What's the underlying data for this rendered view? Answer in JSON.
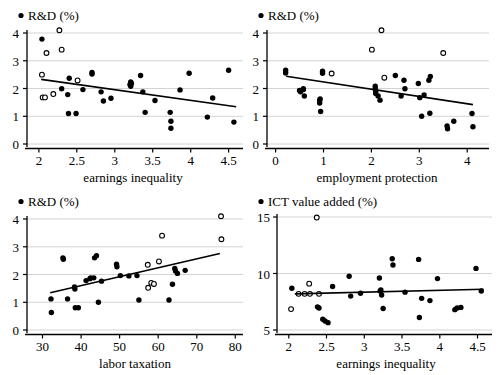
{
  "figure": {
    "title": "",
    "panel_count": 4
  },
  "chart_data": [
    {
      "type": "scatter",
      "panel": "top-left",
      "title": "",
      "legend": [
        {
          "label": "R&D (%)",
          "marker": "filled-circle"
        }
      ],
      "ylabel": "R&D (%)",
      "xlabel": "earnings inequality",
      "xlim": [
        1.85,
        4.7
      ],
      "ylim": [
        -0.25,
        4.35
      ],
      "xticks": [
        2,
        2.5,
        3,
        3.5,
        4,
        4.5
      ],
      "xticklabels": [
        "2",
        "2.5",
        "3",
        "3.5",
        "4",
        "4.5"
      ],
      "yticks": [
        0,
        1,
        2,
        3,
        4
      ],
      "yticklabels": [
        "0",
        "1",
        "2",
        "3",
        "4"
      ],
      "grid": "horizontal",
      "series": [
        {
          "name": "filled",
          "marker": "filled-circle",
          "points": [
            [
              2.04,
              3.78
            ],
            [
              2.3,
              1.99
            ],
            [
              2.38,
              1.78
            ],
            [
              2.4,
              2.37
            ],
            [
              2.39,
              1.1
            ],
            [
              2.49,
              1.1
            ],
            [
              2.58,
              1.96
            ],
            [
              2.7,
              2.58
            ],
            [
              2.7,
              2.52
            ],
            [
              2.82,
              1.88
            ],
            [
              2.85,
              1.55
            ],
            [
              2.95,
              1.65
            ],
            [
              3.2,
              2.14
            ],
            [
              3.21,
              2.24
            ],
            [
              3.21,
              2.08
            ],
            [
              3.22,
              2.18
            ],
            [
              3.34,
              2.47
            ],
            [
              3.37,
              1.88
            ],
            [
              3.4,
              1.14
            ],
            [
              3.53,
              1.57
            ],
            [
              3.73,
              1.14
            ],
            [
              3.74,
              0.82
            ],
            [
              3.74,
              0.57
            ],
            [
              3.86,
              1.95
            ],
            [
              3.98,
              2.55
            ],
            [
              4.22,
              0.97
            ],
            [
              4.29,
              1.66
            ],
            [
              4.5,
              2.66
            ],
            [
              4.57,
              0.79
            ]
          ]
        },
        {
          "name": "open",
          "marker": "open-circle",
          "points": [
            [
              2.04,
              2.5
            ],
            [
              2.05,
              1.68
            ],
            [
              2.08,
              1.68
            ],
            [
              2.1,
              3.28
            ],
            [
              2.19,
              1.8
            ],
            [
              2.27,
              4.1
            ],
            [
              2.3,
              3.4
            ],
            [
              2.51,
              2.29
            ]
          ]
        }
      ],
      "fit_line": {
        "x": [
          2.03,
          4.6
        ],
        "y": [
          2.33,
          1.34
        ]
      }
    },
    {
      "type": "scatter",
      "panel": "top-right",
      "title": "",
      "legend": [
        {
          "label": "R&D (%)",
          "marker": "filled-circle"
        }
      ],
      "ylabel": "R&D (%)",
      "xlabel": "employment protection",
      "xlim": [
        -0.18,
        4.45
      ],
      "ylim": [
        -0.25,
        4.35
      ],
      "xticks": [
        0,
        1,
        2,
        3,
        4
      ],
      "xticklabels": [
        "0",
        "1",
        "2",
        "3",
        "4"
      ],
      "yticks": [
        0,
        1,
        2,
        3,
        4
      ],
      "yticklabels": [
        "0",
        "1",
        "2",
        "3",
        "4"
      ],
      "grid": "horizontal",
      "series": [
        {
          "name": "filled",
          "marker": "filled-circle",
          "points": [
            [
              0.21,
              2.66
            ],
            [
              0.21,
              2.56
            ],
            [
              0.5,
              1.93
            ],
            [
              0.52,
              1.88
            ],
            [
              0.58,
              1.96
            ],
            [
              0.58,
              1.99
            ],
            [
              0.6,
              1.73
            ],
            [
              0.92,
              1.58
            ],
            [
              0.92,
              1.48
            ],
            [
              0.93,
              1.62
            ],
            [
              0.94,
              1.17
            ],
            [
              0.98,
              2.62
            ],
            [
              0.98,
              2.55
            ],
            [
              2.08,
              1.98
            ],
            [
              2.08,
              2.08
            ],
            [
              2.09,
              1.9
            ],
            [
              2.09,
              1.82
            ],
            [
              2.14,
              1.73
            ],
            [
              2.18,
              1.58
            ],
            [
              2.5,
              2.47
            ],
            [
              2.62,
              1.73
            ],
            [
              2.68,
              2.3
            ],
            [
              2.7,
              1.99
            ],
            [
              2.98,
              2.18
            ],
            [
              3.01,
              1.67
            ],
            [
              3.05,
              1.0
            ],
            [
              3.1,
              1.77
            ],
            [
              3.2,
              2.3
            ],
            [
              3.23,
              2.43
            ],
            [
              3.22,
              1.11
            ],
            [
              3.58,
              0.65
            ],
            [
              3.59,
              0.55
            ],
            [
              3.72,
              0.82
            ],
            [
              4.1,
              1.1
            ],
            [
              4.12,
              0.62
            ]
          ]
        },
        {
          "name": "open",
          "marker": "open-circle",
          "points": [
            [
              1.17,
              2.54
            ],
            [
              2.01,
              3.4
            ],
            [
              2.21,
              4.1
            ],
            [
              2.27,
              2.39
            ],
            [
              3.5,
              3.28
            ]
          ]
        }
      ],
      "fit_line": {
        "x": [
          0.22,
          4.12
        ],
        "y": [
          2.44,
          1.42
        ]
      }
    },
    {
      "type": "scatter",
      "panel": "bottom-left",
      "title": "",
      "legend": [
        {
          "label": "R&D (%)",
          "marker": "filled-circle"
        }
      ],
      "ylabel": "R&D (%)",
      "xlabel": "labor taxation",
      "xlim": [
        26,
        82
      ],
      "ylim": [
        -0.25,
        4.35
      ],
      "xticks": [
        30,
        40,
        50,
        60,
        70,
        80
      ],
      "xticklabels": [
        "30",
        "40",
        "50",
        "60",
        "70",
        "80"
      ],
      "yticks": [
        0,
        1,
        2,
        3,
        4
      ],
      "yticklabels": [
        "0",
        "1",
        "2",
        "3",
        "4"
      ],
      "grid": "horizontal",
      "series": [
        {
          "name": "filled",
          "marker": "filled-circle",
          "points": [
            [
              32.2,
              1.12
            ],
            [
              32.3,
              0.63
            ],
            [
              35.3,
              2.6
            ],
            [
              35.4,
              2.55
            ],
            [
              36.5,
              1.12
            ],
            [
              38.3,
              1.55
            ],
            [
              38.4,
              1.48
            ],
            [
              38.5,
              0.8
            ],
            [
              39.3,
              0.8
            ],
            [
              41.3,
              1.78
            ],
            [
              42.3,
              1.85
            ],
            [
              42.5,
              1.88
            ],
            [
              43.3,
              1.88
            ],
            [
              43.5,
              2.6
            ],
            [
              44.0,
              2.68
            ],
            [
              44.5,
              1.0
            ],
            [
              45.3,
              1.76
            ],
            [
              49.2,
              2.37
            ],
            [
              49.3,
              2.28
            ],
            [
              50.2,
              1.96
            ],
            [
              52.4,
              1.95
            ],
            [
              54.5,
              1.96
            ],
            [
              55.0,
              1.08
            ],
            [
              62.8,
              1.08
            ],
            [
              63.7,
              1.65
            ],
            [
              64.3,
              2.22
            ],
            [
              64.5,
              2.13
            ],
            [
              65.0,
              2.04
            ],
            [
              67.0,
              2.15
            ]
          ]
        },
        {
          "name": "open",
          "marker": "open-circle",
          "points": [
            [
              57.3,
              2.35
            ],
            [
              57.4,
              1.52
            ],
            [
              58.2,
              1.7
            ],
            [
              58.9,
              1.66
            ],
            [
              60.2,
              2.47
            ],
            [
              61.0,
              3.4
            ],
            [
              76.3,
              4.1
            ],
            [
              76.4,
              3.27
            ]
          ]
        }
      ],
      "fit_line": {
        "x": [
          32.0,
          76.0
        ],
        "y": [
          1.34,
          2.76
        ]
      }
    },
    {
      "type": "scatter",
      "panel": "bottom-right",
      "title": "",
      "legend": [
        {
          "label": "ICT value added (%)",
          "marker": "filled-circle"
        }
      ],
      "ylabel": "ICT value added (%)",
      "xlabel": "earnings  inequality",
      "xlim": [
        1.85,
        4.7
      ],
      "ylim": [
        4.1,
        15.6
      ],
      "xticks": [
        2,
        2.5,
        3,
        3.5,
        4,
        4.5
      ],
      "xticklabels": [
        "2",
        "2.5",
        "3",
        "3.5",
        "4",
        "4.5"
      ],
      "yticks": [
        5,
        10,
        15
      ],
      "yticklabels": [
        "5",
        "10",
        "15"
      ],
      "grid": "horizontal",
      "series": [
        {
          "name": "filled",
          "marker": "filled-circle",
          "points": [
            [
              2.04,
              8.7
            ],
            [
              2.38,
              7.05
            ],
            [
              2.4,
              6.95
            ],
            [
              2.45,
              5.95
            ],
            [
              2.48,
              5.8
            ],
            [
              2.52,
              5.65
            ],
            [
              2.58,
              8.85
            ],
            [
              2.8,
              9.75
            ],
            [
              2.82,
              8.0
            ],
            [
              2.95,
              8.25
            ],
            [
              3.2,
              9.6
            ],
            [
              3.21,
              8.45
            ],
            [
              3.22,
              8.55
            ],
            [
              3.23,
              8.1
            ],
            [
              3.25,
              6.9
            ],
            [
              3.37,
              11.3
            ],
            [
              3.38,
              10.75
            ],
            [
              3.54,
              8.35
            ],
            [
              3.72,
              11.25
            ],
            [
              3.73,
              6.1
            ],
            [
              3.76,
              7.8
            ],
            [
              3.87,
              7.6
            ],
            [
              3.97,
              9.55
            ],
            [
              4.2,
              6.8
            ],
            [
              4.23,
              6.95
            ],
            [
              4.28,
              7.0
            ],
            [
              4.48,
              10.45
            ],
            [
              4.55,
              8.45
            ]
          ]
        },
        {
          "name": "open",
          "marker": "open-circle",
          "points": [
            [
              2.03,
              6.85
            ],
            [
              2.13,
              8.2
            ],
            [
              2.21,
              8.2
            ],
            [
              2.27,
              9.1
            ],
            [
              2.28,
              8.2
            ],
            [
              2.37,
              14.95
            ],
            [
              2.4,
              8.2
            ]
          ]
        }
      ],
      "fit_line": {
        "x": [
          2.08,
          4.58
        ],
        "y": [
          8.2,
          8.6
        ]
      }
    }
  ]
}
